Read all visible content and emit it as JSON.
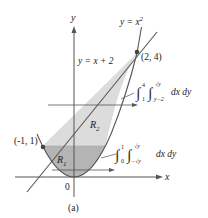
{
  "figure": {
    "caption": "(a)",
    "axes": {
      "x_label": "x",
      "y_label": "y",
      "origin_label": "0"
    },
    "curves": {
      "parabola_label": "y = x",
      "parabola_exponent": "2",
      "line_label": "y = x + 2"
    },
    "points": [
      {
        "label": "(2, 4)",
        "x": 2,
        "y": 4
      },
      {
        "label": "(-1, 1)",
        "x": -1,
        "y": 1
      }
    ],
    "regions": {
      "r1": {
        "label": "R",
        "subscript": "1",
        "color": "#b4b4b4"
      },
      "r2": {
        "label": "R",
        "subscript": "2",
        "color": "#dcdcdc"
      }
    },
    "integrals": {
      "upper": {
        "outer_lower": "1",
        "outer_upper": "4",
        "inner_lower": "y−2",
        "inner_upper": "√y",
        "differentials": "dx dy"
      },
      "lower": {
        "outer_lower": "0",
        "outer_upper": "1",
        "inner_lower": "−√y",
        "inner_upper": "√y",
        "differentials": "dx dy"
      }
    },
    "colors": {
      "curve": "#555555",
      "axis": "#555555",
      "point": "#444444"
    }
  }
}
